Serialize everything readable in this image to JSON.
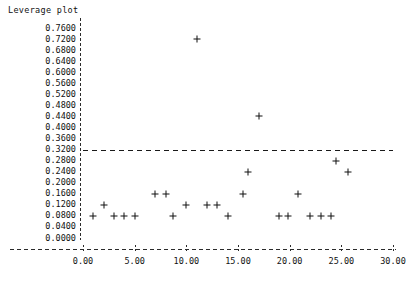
{
  "chart_data": {
    "type": "scatter",
    "title": "Leverage plot",
    "xlabel": "",
    "ylabel": "",
    "grid": false,
    "legend": "none",
    "xlim": [
      0.0,
      30.0
    ],
    "ylim": [
      0.0,
      0.76
    ],
    "xticks": [
      "0.00",
      "5.00",
      "10.00",
      "15.00",
      "20.00",
      "25.00",
      "30.00"
    ],
    "xtick_values": [
      0,
      5,
      10,
      15,
      20,
      25,
      30
    ],
    "yticks": [
      "0.7600",
      "0.7200",
      "0.6800",
      "0.6400",
      "0.6000",
      "0.5600",
      "0.5200",
      "0.4800",
      "0.4400",
      "0.4000",
      "0.3600",
      "0.3200",
      "0.2800",
      "0.2400",
      "0.2000",
      "0.1600",
      "0.1200",
      "0.0800",
      "0.0400",
      "0.0000"
    ],
    "ytick_values": [
      0.76,
      0.72,
      0.68,
      0.64,
      0.6,
      0.56,
      0.52,
      0.48,
      0.44,
      0.4,
      0.36,
      0.32,
      0.28,
      0.24,
      0.2,
      0.16,
      0.12,
      0.08,
      0.04,
      0.0
    ],
    "marker": "plus",
    "marker_color": "#111111",
    "threshold_line": {
      "value": 0.32,
      "style": "dashed",
      "orientation": "horizontal"
    },
    "points": [
      {
        "x": 1.0,
        "y": 0.08
      },
      {
        "x": 2.0,
        "y": 0.12
      },
      {
        "x": 3.0,
        "y": 0.08
      },
      {
        "x": 4.0,
        "y": 0.08
      },
      {
        "x": 5.0,
        "y": 0.08
      },
      {
        "x": 7.0,
        "y": 0.16
      },
      {
        "x": 8.0,
        "y": 0.16
      },
      {
        "x": 8.7,
        "y": 0.08
      },
      {
        "x": 10.0,
        "y": 0.12
      },
      {
        "x": 11.0,
        "y": 0.72
      },
      {
        "x": 12.0,
        "y": 0.12
      },
      {
        "x": 13.0,
        "y": 0.12
      },
      {
        "x": 14.0,
        "y": 0.08
      },
      {
        "x": 15.5,
        "y": 0.16
      },
      {
        "x": 16.0,
        "y": 0.24
      },
      {
        "x": 17.0,
        "y": 0.44
      },
      {
        "x": 19.0,
        "y": 0.08
      },
      {
        "x": 19.8,
        "y": 0.08
      },
      {
        "x": 20.8,
        "y": 0.16
      },
      {
        "x": 22.0,
        "y": 0.08
      },
      {
        "x": 23.0,
        "y": 0.08
      },
      {
        "x": 24.0,
        "y": 0.08
      },
      {
        "x": 24.5,
        "y": 0.28
      },
      {
        "x": 25.6,
        "y": 0.24
      }
    ]
  }
}
